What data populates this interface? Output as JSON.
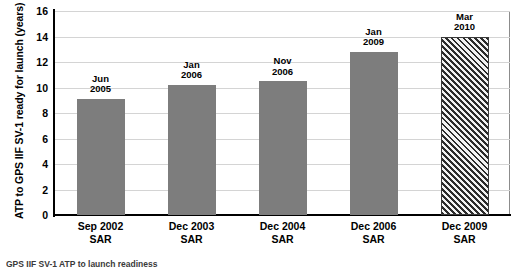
{
  "chart_data": {
    "type": "bar",
    "title": "",
    "xlabel": "",
    "ylabel": "ATP to GPS IIF SV-1 ready for launch (years)",
    "ylim": [
      0,
      16
    ],
    "yticks": [
      "0",
      "2",
      "4",
      "6",
      "8",
      "10",
      "12",
      "14",
      "16"
    ],
    "grid": true,
    "legend": "none",
    "categories": [
      "Sep 2002\nSAR",
      "Dec 2003\nSAR",
      "Dec 2004\nSAR",
      "Dec 2006\nSAR",
      "Dec 2009\nSAR"
    ],
    "category_lines": [
      {
        "line1": "Sep 2002",
        "line2": "SAR"
      },
      {
        "line1": "Dec 2003",
        "line2": "SAR"
      },
      {
        "line1": "Dec 2004",
        "line2": "SAR"
      },
      {
        "line1": "Dec 2006",
        "line2": "SAR"
      },
      {
        "line1": "Dec 2009",
        "line2": "SAR"
      }
    ],
    "values": [
      9.1,
      10.2,
      10.5,
      12.8,
      14.0
    ],
    "point_labels": [
      {
        "line1": "Jun",
        "line2": "2005"
      },
      {
        "line1": "Jan",
        "line2": "2006"
      },
      {
        "line1": "Nov",
        "line2": "2006"
      },
      {
        "line1": "Jan",
        "line2": "2009"
      },
      {
        "line1": "Mar",
        "line2": "2010"
      }
    ],
    "bar_styles": [
      "solid",
      "solid",
      "solid",
      "solid",
      "hatched"
    ],
    "colors": {
      "bar_fill": "#7d7d7d",
      "hatch_line": "#2b2b2b",
      "hatch_background": "#f2f2f2",
      "gridline": "#d4d4d4",
      "axis": "#000000",
      "plot_border": "#8c8c8c",
      "text": "#000000",
      "background": "#ffffff"
    }
  },
  "footer": {
    "caption_clipped": "GPS IIF SV-1 ATP to launch readiness"
  }
}
